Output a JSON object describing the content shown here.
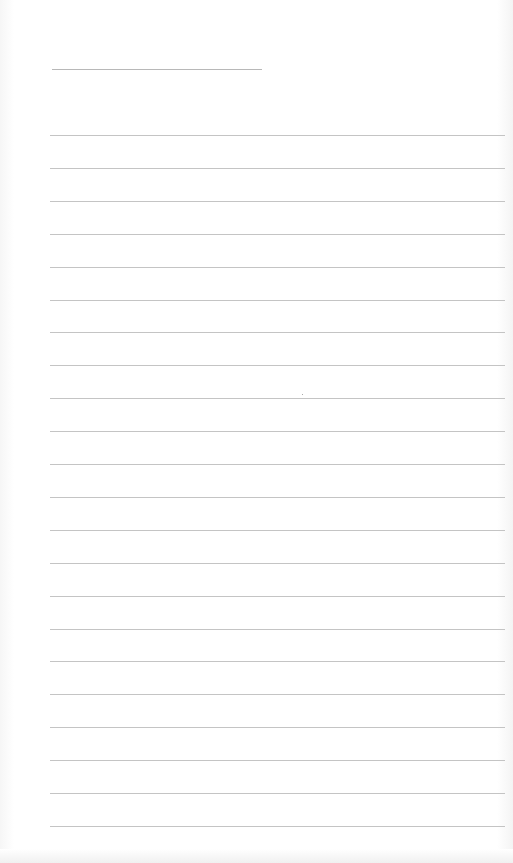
{
  "document": {
    "type": "lined-paper",
    "title_line": {
      "x": 52,
      "y": 69,
      "width": 210
    },
    "rules": {
      "count": 22,
      "start_y": 135,
      "spacing": 32.9,
      "left": 50,
      "width": 455
    },
    "colors": {
      "paper": "#ffffff",
      "rule": "#c4c4c4",
      "title_line": "#b8b8b8"
    }
  }
}
